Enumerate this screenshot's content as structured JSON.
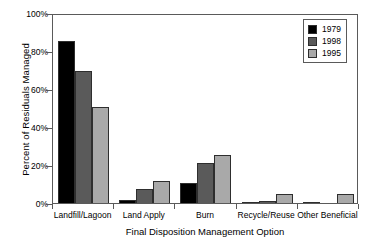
{
  "chart_data": {
    "type": "bar",
    "title": "",
    "xlabel": "Final Disposition Management Option",
    "ylabel": "Percent of Residuals Managed",
    "categories": [
      "Landfill/Lagoon",
      "Land Apply",
      "Burn",
      "Recycle/Reuse",
      "Other Beneficial"
    ],
    "series": [
      {
        "name": "1979",
        "color": "#000000",
        "values": [
          85.5,
          1.5,
          10.5,
          0.4,
          0.5
        ]
      },
      {
        "name": "1998",
        "color": "#5a5a5a",
        "values": [
          69.5,
          7.5,
          21.0,
          0.8,
          0.0
        ]
      },
      {
        "name": "1995",
        "color": "#a9a9a9",
        "values": [
          50.5,
          11.5,
          25.5,
          5.0,
          5.0
        ]
      }
    ],
    "ylim": [
      0,
      100
    ],
    "ytick_labels": [
      "0%",
      "20%",
      "40%",
      "60%",
      "80%",
      "100%"
    ],
    "ytick_values": [
      0,
      20,
      40,
      60,
      80,
      100
    ],
    "grid": false,
    "legend_position": "top-right"
  },
  "legend": {
    "entries": [
      {
        "label": "1979"
      },
      {
        "label": "1998"
      },
      {
        "label": "1995"
      }
    ]
  }
}
